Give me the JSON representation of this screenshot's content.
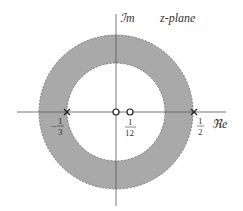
{
  "diagram": {
    "title": "z-plane",
    "axes": {
      "imag_label": "ℐm",
      "real_label": "ℜe"
    },
    "region": {
      "type": "annulus",
      "inner_radius_value": "1/3",
      "outer_radius_value": "1/2",
      "fill_color": "#a9a9a9",
      "boundary_style": "dashed"
    },
    "poles": [
      {
        "value": "-1/3",
        "marker": "x",
        "label_num": "1",
        "label_den": "3",
        "label_sign": "−"
      },
      {
        "value": "1/2",
        "marker": "x",
        "label_num": "1",
        "label_den": "2",
        "label_sign": ""
      }
    ],
    "zeros": [
      {
        "value": "0",
        "marker": "o"
      },
      {
        "value": "1/12",
        "marker": "o",
        "label_num": "1",
        "label_den": "12"
      }
    ],
    "colors": {
      "ring": "#a9a9a9",
      "axis": "#555555",
      "text": "#333333"
    }
  }
}
